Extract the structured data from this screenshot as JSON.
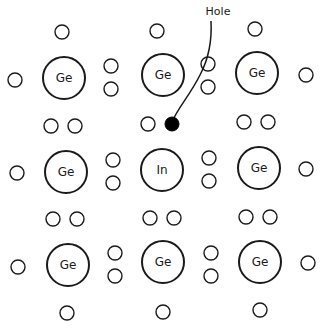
{
  "diagram": {
    "hole_label": "Hole",
    "atoms": [
      {
        "label": "Ge",
        "x": 64,
        "y": 78
      },
      {
        "label": "Ge",
        "x": 163,
        "y": 75
      },
      {
        "label": "Ge",
        "x": 257,
        "y": 73
      },
      {
        "label": "Ge",
        "x": 66,
        "y": 172
      },
      {
        "label": "In",
        "x": 162,
        "y": 170
      },
      {
        "label": "Ge",
        "x": 259,
        "y": 168
      },
      {
        "label": "Ge",
        "x": 68,
        "y": 265
      },
      {
        "label": "Ge",
        "x": 163,
        "y": 262
      },
      {
        "label": "Ge",
        "x": 260,
        "y": 262
      }
    ],
    "electrons": [
      {
        "x": 62,
        "y": 32
      },
      {
        "x": 157,
        "y": 31
      },
      {
        "x": 255,
        "y": 29
      },
      {
        "x": 15,
        "y": 80
      },
      {
        "x": 111,
        "y": 66
      },
      {
        "x": 111,
        "y": 89
      },
      {
        "x": 208,
        "y": 64
      },
      {
        "x": 208,
        "y": 87
      },
      {
        "x": 306,
        "y": 75
      },
      {
        "x": 51,
        "y": 126
      },
      {
        "x": 75,
        "y": 126
      },
      {
        "x": 148,
        "y": 124
      },
      {
        "x": 244,
        "y": 122
      },
      {
        "x": 268,
        "y": 122
      },
      {
        "x": 17,
        "y": 173
      },
      {
        "x": 113,
        "y": 160
      },
      {
        "x": 113,
        "y": 183
      },
      {
        "x": 209,
        "y": 158
      },
      {
        "x": 209,
        "y": 181
      },
      {
        "x": 306,
        "y": 169
      },
      {
        "x": 53,
        "y": 219
      },
      {
        "x": 77,
        "y": 219
      },
      {
        "x": 150,
        "y": 218
      },
      {
        "x": 174,
        "y": 218
      },
      {
        "x": 246,
        "y": 217
      },
      {
        "x": 270,
        "y": 217
      },
      {
        "x": 18,
        "y": 267
      },
      {
        "x": 115,
        "y": 253
      },
      {
        "x": 115,
        "y": 276
      },
      {
        "x": 211,
        "y": 253
      },
      {
        "x": 211,
        "y": 276
      },
      {
        "x": 308,
        "y": 263
      },
      {
        "x": 67,
        "y": 313
      },
      {
        "x": 163,
        "y": 312
      },
      {
        "x": 260,
        "y": 310
      }
    ],
    "hole": {
      "x": 172,
      "y": 124
    },
    "hole_label_pos": {
      "x": 218,
      "y": 15
    }
  }
}
